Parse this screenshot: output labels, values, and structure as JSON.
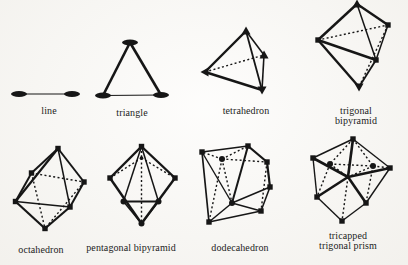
{
  "ink": "#161616",
  "background": "#fbfaf7",
  "figures": [
    {
      "id": "line",
      "label": "line",
      "vertices": [
        {
          "x": 19,
          "y": 94,
          "m": "ellipse"
        },
        {
          "x": 72,
          "y": 94,
          "m": "ellipse"
        }
      ],
      "edges": [
        {
          "a": 0,
          "b": 1,
          "s": "solid",
          "w": 1.2
        }
      ]
    },
    {
      "id": "triangle",
      "label": "triangle",
      "vertices": [
        {
          "x": 130,
          "y": 42.5,
          "m": "ellipse"
        },
        {
          "x": 103,
          "y": 95.5,
          "m": "ellipse"
        },
        {
          "x": 161,
          "y": 95,
          "m": "ellipse"
        }
      ],
      "edges": [
        {
          "a": 0,
          "b": 1,
          "s": "solid",
          "w": 2.6
        },
        {
          "a": 0,
          "b": 2,
          "s": "solid",
          "w": 2.6
        },
        {
          "a": 1,
          "b": 2,
          "s": "solid",
          "w": 1.2
        }
      ]
    },
    {
      "id": "tetrahedron",
      "label": "tetrahedron",
      "vertices": [
        {
          "x": 246,
          "y": 31,
          "m": "tri-up"
        },
        {
          "x": 205,
          "y": 72,
          "m": "tri-left"
        },
        {
          "x": 264,
          "y": 55,
          "m": "tri-up"
        },
        {
          "x": 262,
          "y": 90,
          "m": "tri-down"
        }
      ],
      "edges": [
        {
          "a": 0,
          "b": 1,
          "s": "solid",
          "w": 2.4
        },
        {
          "a": 0,
          "b": 2,
          "s": "solid",
          "w": 1.6
        },
        {
          "a": 0,
          "b": 3,
          "s": "solid",
          "w": 1.8
        },
        {
          "a": 1,
          "b": 3,
          "s": "solid",
          "w": 2.4
        },
        {
          "a": 2,
          "b": 3,
          "s": "solid",
          "w": 1.6
        },
        {
          "a": 1,
          "b": 2,
          "s": "dashed",
          "w": 1.4
        }
      ]
    },
    {
      "id": "trigonal-bipyramid",
      "label": "trigonal bipyramid",
      "vertices": [
        {
          "x": 357,
          "y": 4,
          "m": "tri-up"
        },
        {
          "x": 388,
          "y": 25,
          "m": "square"
        },
        {
          "x": 318,
          "y": 40,
          "m": "square"
        },
        {
          "x": 376,
          "y": 60,
          "m": "square"
        },
        {
          "x": 359,
          "y": 87,
          "m": "tri-down"
        }
      ],
      "edges": [
        {
          "a": 0,
          "b": 1,
          "s": "solid",
          "w": 2.4
        },
        {
          "a": 0,
          "b": 2,
          "s": "solid",
          "w": 2.4
        },
        {
          "a": 0,
          "b": 3,
          "s": "solid",
          "w": 1.5
        },
        {
          "a": 1,
          "b": 3,
          "s": "solid",
          "w": 1.5
        },
        {
          "a": 2,
          "b": 3,
          "s": "solid",
          "w": 2.4
        },
        {
          "a": 2,
          "b": 4,
          "s": "solid",
          "w": 2.4
        },
        {
          "a": 3,
          "b": 4,
          "s": "solid",
          "w": 1.8
        },
        {
          "a": 2,
          "b": 1,
          "s": "dashed",
          "w": 1.4
        },
        {
          "a": 1,
          "b": 4,
          "s": "dashed",
          "w": 1.4
        }
      ]
    },
    {
      "id": "octahedron",
      "label": "octahedron",
      "vertices": [
        {
          "x": 58,
          "y": 148.5,
          "m": "square"
        },
        {
          "x": 31.5,
          "y": 173,
          "m": "square"
        },
        {
          "x": 84,
          "y": 182,
          "m": "square"
        },
        {
          "x": 15.5,
          "y": 201.5,
          "m": "square"
        },
        {
          "x": 70,
          "y": 207,
          "m": "square"
        },
        {
          "x": 45,
          "y": 228.5,
          "m": "square"
        }
      ],
      "edges": [
        {
          "a": 0,
          "b": 1,
          "s": "solid",
          "w": 2.0
        },
        {
          "a": 0,
          "b": 3,
          "s": "solid",
          "w": 2.2
        },
        {
          "a": 0,
          "b": 2,
          "s": "solid",
          "w": 2.0
        },
        {
          "a": 0,
          "b": 4,
          "s": "solid",
          "w": 1.5
        },
        {
          "a": 1,
          "b": 3,
          "s": "solid",
          "w": 2.0
        },
        {
          "a": 3,
          "b": 4,
          "s": "solid",
          "w": 1.3
        },
        {
          "a": 2,
          "b": 4,
          "s": "solid",
          "w": 2.0
        },
        {
          "a": 3,
          "b": 5,
          "s": "solid",
          "w": 2.2
        },
        {
          "a": 4,
          "b": 5,
          "s": "solid",
          "w": 2.2
        },
        {
          "a": 1,
          "b": 2,
          "s": "dashed",
          "w": 1.4
        },
        {
          "a": 1,
          "b": 5,
          "s": "dashed",
          "w": 1.4
        },
        {
          "a": 2,
          "b": 5,
          "s": "dashed",
          "w": 1.4
        }
      ]
    },
    {
      "id": "pentagonal-bipyramid",
      "label": "pentagonal bipyramid",
      "vertices": [
        {
          "x": 141.5,
          "y": 146.5,
          "m": "square"
        },
        {
          "x": 141.5,
          "y": 158,
          "m": "dot"
        },
        {
          "x": 110,
          "y": 178,
          "m": "square"
        },
        {
          "x": 175,
          "y": 178,
          "m": "square"
        },
        {
          "x": 123.5,
          "y": 201.5,
          "m": "circle"
        },
        {
          "x": 158.5,
          "y": 201.5,
          "m": "circle"
        },
        {
          "x": 141.5,
          "y": 223.5,
          "m": "circle"
        }
      ],
      "edges": [
        {
          "a": 0,
          "b": 2,
          "s": "solid",
          "w": 2.4
        },
        {
          "a": 0,
          "b": 3,
          "s": "solid",
          "w": 2.4
        },
        {
          "a": 2,
          "b": 6,
          "s": "solid",
          "w": 2.4
        },
        {
          "a": 3,
          "b": 6,
          "s": "solid",
          "w": 2.4
        },
        {
          "a": 0,
          "b": 4,
          "s": "solid",
          "w": 1.5
        },
        {
          "a": 0,
          "b": 5,
          "s": "solid",
          "w": 1.5
        },
        {
          "a": 4,
          "b": 5,
          "s": "solid",
          "w": 1.8
        },
        {
          "a": 4,
          "b": 6,
          "s": "solid",
          "w": 1.5
        },
        {
          "a": 5,
          "b": 6,
          "s": "solid",
          "w": 1.5
        },
        {
          "a": 0,
          "b": 1,
          "s": "dashed",
          "w": 1.4
        },
        {
          "a": 1,
          "b": 2,
          "s": "dashed",
          "w": 1.4
        },
        {
          "a": 1,
          "b": 3,
          "s": "dashed",
          "w": 1.4
        },
        {
          "a": 1,
          "b": 6,
          "s": "dashed",
          "w": 1.4
        }
      ]
    },
    {
      "id": "dodecahedron",
      "label": "dodecahedron",
      "vertices": [
        {
          "x": 202,
          "y": 152,
          "m": "square"
        },
        {
          "x": 248,
          "y": 146,
          "m": "square"
        },
        {
          "x": 222,
          "y": 159,
          "m": "circle"
        },
        {
          "x": 267,
          "y": 162,
          "m": "square"
        },
        {
          "x": 270,
          "y": 187,
          "m": "square"
        },
        {
          "x": 232,
          "y": 203,
          "m": "circle"
        },
        {
          "x": 209,
          "y": 222,
          "m": "square"
        },
        {
          "x": 261,
          "y": 211,
          "m": "square"
        }
      ],
      "edges": [
        {
          "a": 0,
          "b": 1,
          "s": "solid",
          "w": 1.6
        },
        {
          "a": 1,
          "b": 3,
          "s": "solid",
          "w": 2.2
        },
        {
          "a": 3,
          "b": 4,
          "s": "solid",
          "w": 2.2
        },
        {
          "a": 4,
          "b": 7,
          "s": "solid",
          "w": 1.6
        },
        {
          "a": 7,
          "b": 6,
          "s": "solid",
          "w": 1.4
        },
        {
          "a": 6,
          "b": 0,
          "s": "solid",
          "w": 1.7
        },
        {
          "a": 0,
          "b": 5,
          "s": "solid",
          "w": 1.4
        },
        {
          "a": 1,
          "b": 5,
          "s": "solid",
          "w": 2.0
        },
        {
          "a": 4,
          "b": 5,
          "s": "solid",
          "w": 1.4
        },
        {
          "a": 5,
          "b": 6,
          "s": "solid",
          "w": 1.5
        },
        {
          "a": 5,
          "b": 7,
          "s": "solid",
          "w": 1.4
        },
        {
          "a": 2,
          "b": 0,
          "s": "dashed",
          "w": 1.4
        },
        {
          "a": 2,
          "b": 1,
          "s": "dashed",
          "w": 1.4
        },
        {
          "a": 2,
          "b": 3,
          "s": "dashed",
          "w": 1.4
        },
        {
          "a": 2,
          "b": 5,
          "s": "dashed",
          "w": 1.4
        },
        {
          "a": 2,
          "b": 6,
          "s": "dashed",
          "w": 1.4
        },
        {
          "a": 3,
          "b": 7,
          "s": "dashed",
          "w": 1.4
        }
      ]
    },
    {
      "id": "tricapped-trigonal-prism",
      "label": "tricapped\ntrigonal prism",
      "vertices": [
        {
          "x": 353,
          "y": 139,
          "m": "square"
        },
        {
          "x": 313,
          "y": 158,
          "m": "square"
        },
        {
          "x": 390,
          "y": 168,
          "m": "square"
        },
        {
          "x": 330,
          "y": 164,
          "m": "circle"
        },
        {
          "x": 373,
          "y": 166,
          "m": "circle"
        },
        {
          "x": 348,
          "y": 177,
          "m": "dot"
        },
        {
          "x": 317,
          "y": 197,
          "m": "square"
        },
        {
          "x": 366,
          "y": 203,
          "m": "square"
        },
        {
          "x": 342,
          "y": 221,
          "m": "square"
        }
      ],
      "edges": [
        {
          "a": 5,
          "b": 0,
          "s": "solid",
          "w": 2.6
        },
        {
          "a": 5,
          "b": 1,
          "s": "solid",
          "w": 2.6
        },
        {
          "a": 5,
          "b": 6,
          "s": "solid",
          "w": 2.6
        },
        {
          "a": 5,
          "b": 7,
          "s": "solid",
          "w": 2.6
        },
        {
          "a": 5,
          "b": 2,
          "s": "solid",
          "w": 2.6
        },
        {
          "a": 0,
          "b": 1,
          "s": "solid",
          "w": 1.4
        },
        {
          "a": 1,
          "b": 6,
          "s": "solid",
          "w": 1.4
        },
        {
          "a": 6,
          "b": 8,
          "s": "solid",
          "w": 1.4
        },
        {
          "a": 8,
          "b": 7,
          "s": "solid",
          "w": 1.4
        },
        {
          "a": 7,
          "b": 2,
          "s": "solid",
          "w": 1.4
        },
        {
          "a": 2,
          "b": 0,
          "s": "solid",
          "w": 1.4
        },
        {
          "a": 0,
          "b": 3,
          "s": "dashed",
          "w": 1.4
        },
        {
          "a": 0,
          "b": 4,
          "s": "dashed",
          "w": 1.4
        },
        {
          "a": 3,
          "b": 4,
          "s": "dashed",
          "w": 1.4
        },
        {
          "a": 4,
          "b": 2,
          "s": "dashed",
          "w": 1.4
        },
        {
          "a": 3,
          "b": 6,
          "s": "dashed",
          "w": 1.4
        },
        {
          "a": 4,
          "b": 7,
          "s": "dashed",
          "w": 1.4
        },
        {
          "a": 3,
          "b": 5,
          "s": "dashed",
          "w": 1.4
        },
        {
          "a": 4,
          "b": 5,
          "s": "dashed",
          "w": 1.4
        },
        {
          "a": 5,
          "b": 8,
          "s": "dashed",
          "w": 1.4
        }
      ]
    }
  ]
}
